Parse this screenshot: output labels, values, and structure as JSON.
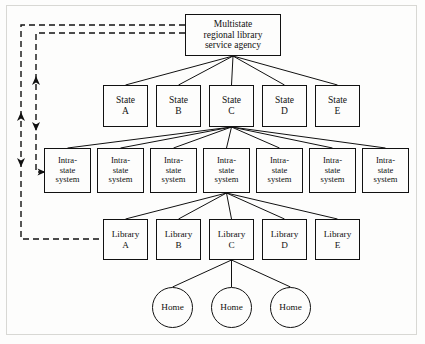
{
  "figure": {
    "background": "#fdfdfc",
    "line_color": "#111111",
    "frame_color": "#d8d8d4"
  },
  "levels": {
    "agency": {
      "lines": [
        "Multistate",
        "regional library",
        "service agency"
      ],
      "box": {
        "x": 185,
        "y": 14,
        "w": 96,
        "h": 42
      }
    },
    "states": {
      "label_prefix": "State",
      "items": [
        {
          "line1": "State",
          "line2": "A",
          "x": 103,
          "y": 85,
          "w": 45,
          "h": 42
        },
        {
          "line1": "State",
          "line2": "B",
          "x": 156,
          "y": 85,
          "w": 45,
          "h": 42
        },
        {
          "line1": "State",
          "line2": "C",
          "x": 209,
          "y": 85,
          "w": 45,
          "h": 42
        },
        {
          "line1": "State",
          "line2": "D",
          "x": 262,
          "y": 85,
          "w": 45,
          "h": 42
        },
        {
          "line1": "State",
          "line2": "E",
          "x": 315,
          "y": 85,
          "w": 45,
          "h": 42
        }
      ]
    },
    "intrastate": {
      "lines": [
        "Intra-",
        "state",
        "system"
      ],
      "items": [
        {
          "x": 44,
          "y": 148,
          "w": 47,
          "h": 45
        },
        {
          "x": 97,
          "y": 148,
          "w": 47,
          "h": 45
        },
        {
          "x": 150,
          "y": 148,
          "w": 47,
          "h": 45
        },
        {
          "x": 203,
          "y": 148,
          "w": 47,
          "h": 45
        },
        {
          "x": 256,
          "y": 148,
          "w": 47,
          "h": 45
        },
        {
          "x": 309,
          "y": 148,
          "w": 47,
          "h": 45
        },
        {
          "x": 362,
          "y": 148,
          "w": 47,
          "h": 45
        }
      ]
    },
    "libraries": {
      "label_prefix": "Library",
      "items": [
        {
          "line1": "Library",
          "line2": "A",
          "x": 103,
          "y": 219,
          "w": 45,
          "h": 41
        },
        {
          "line1": "Library",
          "line2": "B",
          "x": 156,
          "y": 219,
          "w": 45,
          "h": 41
        },
        {
          "line1": "Library",
          "line2": "C",
          "x": 209,
          "y": 219,
          "w": 45,
          "h": 41
        },
        {
          "line1": "Library",
          "line2": "D",
          "x": 262,
          "y": 219,
          "w": 45,
          "h": 41
        },
        {
          "line1": "Library",
          "line2": "E",
          "x": 315,
          "y": 219,
          "w": 45,
          "h": 41
        }
      ]
    },
    "homes": {
      "label": "Home",
      "items": [
        {
          "label": "Home",
          "x": 152,
          "y": 287,
          "d": 41
        },
        {
          "label": "Home",
          "x": 211,
          "y": 287,
          "d": 41
        },
        {
          "label": "Home",
          "x": 270,
          "y": 287,
          "d": 41
        }
      ]
    }
  },
  "connections": {
    "agency_to_states": {
      "from": "agency",
      "to": "states",
      "count": 5,
      "style": "solid"
    },
    "stateC_to_intrastate": {
      "from": "State C",
      "to": "intrastate",
      "count": 7,
      "style": "solid"
    },
    "intrastate4_to_libraries": {
      "from": "Intra-state system 4",
      "to": "libraries",
      "count": 5,
      "style": "solid"
    },
    "libraryC_to_homes": {
      "from": "Library C",
      "to": "homes",
      "count": 3,
      "style": "solid"
    }
  },
  "feedback_loops": [
    {
      "name": "outer-feedback-loop",
      "style": "dashed",
      "from": "agency",
      "to": "Library A",
      "arrows": [
        "up",
        "down"
      ]
    },
    {
      "name": "inner-feedback-loop",
      "style": "dashed",
      "from": "agency",
      "to": "Intra-state system 1",
      "arrows": [
        "up",
        "down"
      ]
    }
  ]
}
